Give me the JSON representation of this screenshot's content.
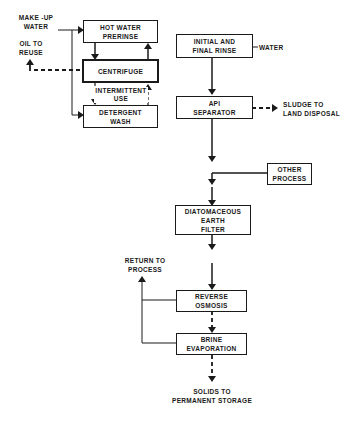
{
  "diagram": {
    "type": "process-flow",
    "boxes": {
      "hot_water_prerinse": {
        "line1": "HOT WATER",
        "line2": "PRERINSE"
      },
      "centrifuge": {
        "line1": "CENTRIFUGE"
      },
      "detergent_wash": {
        "line1": "DETERGENT",
        "line2": "WASH"
      },
      "initial_final_rinse": {
        "line1": "INITIAL AND",
        "line2": "FINAL RINSE"
      },
      "api_separator": {
        "line1": "API",
        "line2": "SEPARATOR"
      },
      "other_process": {
        "line1": "OTHER",
        "line2": "PROCESS"
      },
      "diatomaceous_filter": {
        "line1": "DIATOMACEOUS",
        "line2": "EARTH",
        "line3": "FILTER"
      },
      "reverse_osmosis": {
        "line1": "REVERSE",
        "line2": "OSMOSIS"
      },
      "brine_evaporation": {
        "line1": "BRINE",
        "line2": "EVAPORATION"
      }
    },
    "labels": {
      "makeup_water": {
        "line1": "MAKE -UP",
        "line2": "WATER"
      },
      "oil_to_reuse": {
        "line1": "OIL TO",
        "line2": "REUSE"
      },
      "intermittent_use": {
        "line1": "INTERMITTENT",
        "line2": "USE"
      },
      "water": "WATER",
      "sludge": {
        "line1": "SLUDGE TO",
        "line2": "LAND DISPOSAL"
      },
      "return_to_process": {
        "line1": "RETURN TO",
        "line2": "PROCESS"
      },
      "solids": {
        "line1": "SOLIDS TO",
        "line2": "PERMANENT STORAGE"
      }
    },
    "colors": {
      "ink": "#1a1a1a",
      "background": "#ffffff"
    }
  }
}
